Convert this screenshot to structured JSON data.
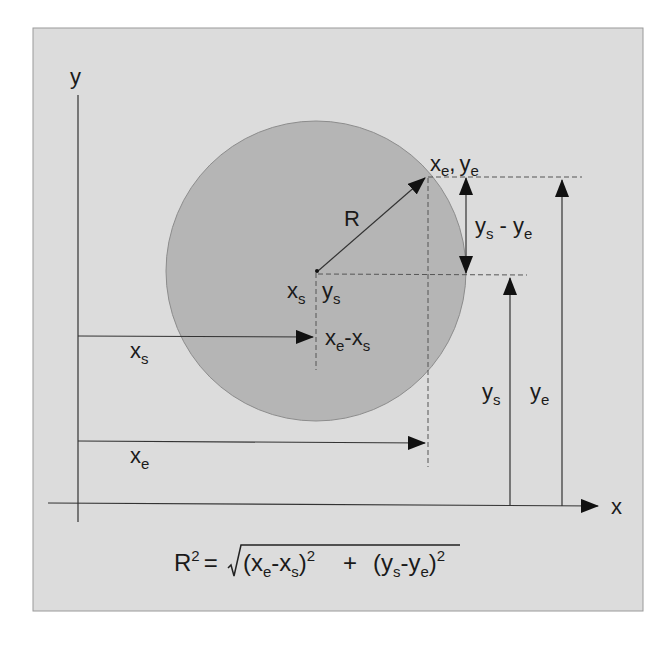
{
  "figure": {
    "background_panel_color": "#dcdcdc",
    "circle_fill_color": "#b5b5b5",
    "line_color": "#333333"
  },
  "axes": {
    "x_label": "x",
    "y_label": "y"
  },
  "labels": {
    "radius": "R",
    "center": {
      "x_main": "x",
      "x_sub": "s",
      "y_main": "y",
      "y_sub": "s"
    },
    "edge_point": {
      "x_main": "x",
      "x_sub": "e",
      "sep": ",",
      "y_main": "y",
      "y_sub": "e"
    },
    "dx": {
      "a_main": "x",
      "a_sub": "e",
      "op": "-",
      "b_main": "x",
      "b_sub": "s"
    },
    "dy": {
      "a_main": "y",
      "a_sub": "s",
      "op": " - ",
      "b_main": "y",
      "b_sub": "e"
    },
    "xs_arrow": {
      "main": "x",
      "sub": "s"
    },
    "xe_arrow": {
      "main": "x",
      "sub": "e"
    },
    "ys_arrow": {
      "main": "y",
      "sub": "s"
    },
    "ye_arrow": {
      "main": "y",
      "sub": "e"
    }
  },
  "formula": {
    "lhs_main": "R",
    "lhs_sup": "2",
    "equals": "=",
    "term1_open": "(x",
    "term1_sub1": "e",
    "term1_mid": "-x",
    "term1_sub2": "s",
    "term1_close": ")",
    "term1_sup": "2",
    "plus": "+",
    "term2_open": "(y",
    "term2_sub1": "s",
    "term2_mid": "-y",
    "term2_sub2": "e",
    "term2_close": ")",
    "term2_sup": "2"
  }
}
